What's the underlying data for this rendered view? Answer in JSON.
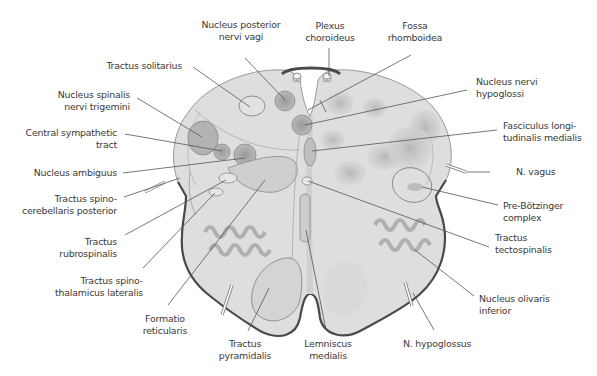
{
  "diagram": {
    "type": "anatomical cross-section",
    "colors": {
      "tissue": "#d9d9d9",
      "tissue_light": "#e6e6e6",
      "nucleus": "#a8a8a8",
      "outline": "#555555",
      "leader_line": "#555555",
      "text": "#3a3a3a"
    }
  },
  "labels": {
    "nucleus_posterior_nervi_vagi": {
      "line1": "Nucleus posterior",
      "line2": "nervi vagi"
    },
    "plexus_choroideus": {
      "line1": "Plexus",
      "line2": "choroideus"
    },
    "fossa_rhomboidea": {
      "line1": "Fossa",
      "line2": "rhomboidea"
    },
    "tractus_solitarius": {
      "line1": "Tractus solitarius"
    },
    "nucleus_spinalis_nervi_trigemini": {
      "line1": "Nucleus spinalis",
      "line2": "nervi trigemini"
    },
    "central_sympathetic_tract": {
      "line1": "Central sympathetic",
      "line2": "tract"
    },
    "nucleus_ambiguus": {
      "line1": "Nucleus ambiguus"
    },
    "tractus_spinocerebellaris_posterior": {
      "line1": "Tractus spino-",
      "line2": "cerebellaris posterior"
    },
    "tractus_rubrospinalis": {
      "line1": "Tractus",
      "line2": "rubrospinalis"
    },
    "tractus_spinothalamicus_lateralis": {
      "line1": "Tractus spino-",
      "line2": "thalamicus lateralis"
    },
    "formatio_reticularis": {
      "line1": "Formatio",
      "line2": "reticularis"
    },
    "tractus_pyramidalis": {
      "line1": "Tractus",
      "line2": "pyramidalis"
    },
    "lemniscus_medialis": {
      "line1": "Lemniscus",
      "line2": "medialis"
    },
    "n_hypoglossus": {
      "line1": "N. hypoglossus"
    },
    "nucleus_nervi_hypoglossi": {
      "line1": "Nucleus nervi",
      "line2": "hypoglossi"
    },
    "fasciculus_longitudinalis_medialis": {
      "line1": "Fasciculus longi-",
      "line2": "tudinalis medialis"
    },
    "n_vagus": {
      "line1": "N. vagus"
    },
    "pre_botzinger_complex": {
      "line1": "Pre-Bötzinger",
      "line2": "complex"
    },
    "tractus_tectospinalis": {
      "line1": "Tractus",
      "line2": "tectospinalis"
    },
    "nucleus_olivaris_inferior": {
      "line1": "Nucleus olivaris",
      "line2": "inferior"
    }
  }
}
